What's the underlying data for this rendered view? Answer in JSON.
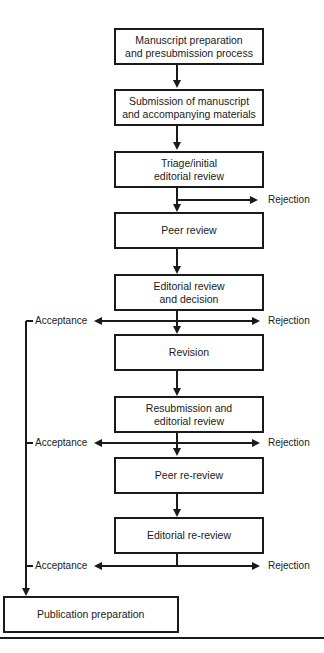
{
  "diagram": {
    "type": "flowchart",
    "steps": [
      {
        "id": "s1",
        "label": "Manuscript preparation and presubmission process",
        "line1": "Manuscript preparation",
        "line2": "and presubmission process"
      },
      {
        "id": "s2",
        "label": "Submission of manuscript and accompanying materials",
        "line1": "Submission of manuscript",
        "line2": "and accompanying materials"
      },
      {
        "id": "s3",
        "label": "Triage/initial editorial review",
        "line1": "Triage/initial",
        "line2": "editorial review"
      },
      {
        "id": "s4",
        "label": "Peer review",
        "line1": "Peer review"
      },
      {
        "id": "s5",
        "label": "Editorial review and decision",
        "line1": "Editorial review",
        "line2": "and decision"
      },
      {
        "id": "s6",
        "label": "Revision",
        "line1": "Revision"
      },
      {
        "id": "s7",
        "label": "Resubmission and editorial review",
        "line1": "Resubmission and",
        "line2": "editorial review"
      },
      {
        "id": "s8",
        "label": "Peer re-review",
        "line1": "Peer re-review"
      },
      {
        "id": "s9",
        "label": "Editorial re-review",
        "line1": "Editorial re-review"
      },
      {
        "id": "s10",
        "label": "Publication preparation",
        "line1": "Publication preparation"
      }
    ],
    "outcomes": {
      "acceptance": "Acceptance",
      "rejection": "Rejection"
    },
    "branches": [
      {
        "from": "s3",
        "rejection": "Rejection"
      },
      {
        "from": "s5",
        "acceptance": "Acceptance",
        "rejection": "Rejection"
      },
      {
        "from": "s7",
        "acceptance": "Acceptance",
        "rejection": "Rejection"
      },
      {
        "from": "s9",
        "acceptance": "Acceptance",
        "rejection": "Rejection"
      }
    ]
  }
}
